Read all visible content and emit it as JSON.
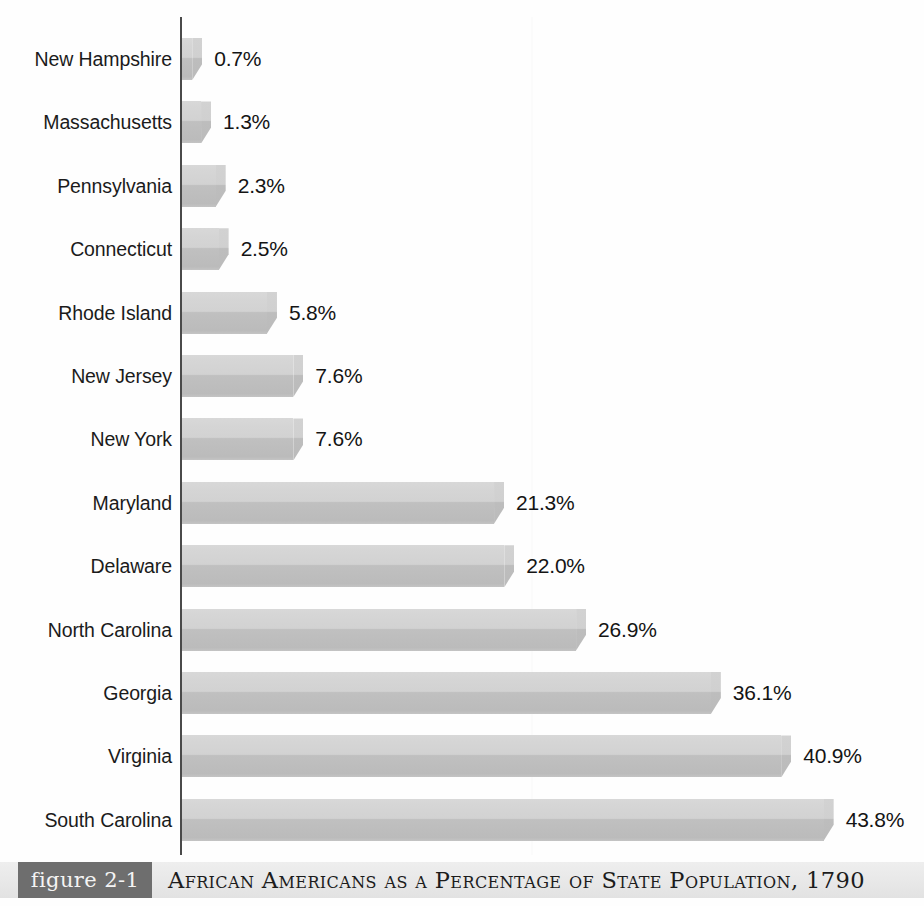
{
  "figure": {
    "tag": "figure 2-1",
    "title": "African Americans as a Percentage of State Population, 1790"
  },
  "chart_data": {
    "type": "bar",
    "orientation": "horizontal",
    "title": "African Americans as a Percentage of State Population, 1790",
    "xlabel": "",
    "ylabel": "",
    "xlim": [
      0,
      44
    ],
    "grid": false,
    "legend": null,
    "units": "percent",
    "categories": [
      "New Hampshire",
      "Massachusetts",
      "Pennsylvania",
      "Connecticut",
      "Rhode Island",
      "New Jersey",
      "New York",
      "Maryland",
      "Delaware",
      "North Carolina",
      "Georgia",
      "Virginia",
      "South Carolina"
    ],
    "values": [
      0.7,
      1.3,
      2.3,
      2.5,
      5.8,
      7.6,
      7.6,
      21.3,
      22.0,
      26.9,
      36.1,
      40.9,
      43.8
    ],
    "data_labels": [
      "0.7%",
      "1.3%",
      "2.3%",
      "2.5%",
      "5.8%",
      "7.6%",
      "7.6%",
      "21.3%",
      "22.0%",
      "26.9%",
      "36.1%",
      "40.9%",
      "43.8%"
    ],
    "bar_color": "#cccccc",
    "axis_color": "#4a4a4a"
  }
}
